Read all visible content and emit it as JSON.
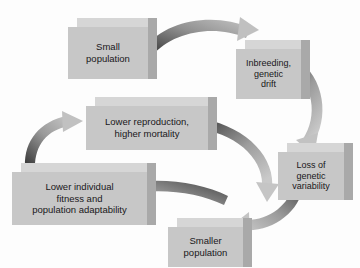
{
  "diagram": {
    "type": "cycle-flow-diagram",
    "background_color": "#fdfdfd",
    "box_front_color": "#c7c7c7",
    "box_top_color": "#d6d6d6",
    "box_side_color": "#a9a9a9",
    "text_color": "#19171a",
    "arrow_dark_color": "#3a3a3a",
    "arrow_light_color": "#c0c0c0",
    "nodes": [
      {
        "id": "small-population",
        "label": "Small\npopulation",
        "x": 68,
        "y": 18,
        "w": 80,
        "h": 52,
        "depth": 9,
        "font_size": 9.5
      },
      {
        "id": "inbreeding-genetic-drift",
        "label": "Inbreeding,\ngenetic\ndrift",
        "x": 236,
        "y": 40,
        "w": 65,
        "h": 50,
        "depth": 9,
        "font_size": 9
      },
      {
        "id": "loss-of-genetic-variability",
        "label": "Loss of\ngenetic\nvariability",
        "x": 278,
        "y": 143,
        "w": 66,
        "h": 48,
        "depth": 9,
        "font_size": 9
      },
      {
        "id": "smaller-population",
        "label": "Smaller\npopulation",
        "x": 168,
        "y": 218,
        "w": 75,
        "h": 40,
        "depth": 9,
        "font_size": 9.5
      },
      {
        "id": "lower-individual-fitness",
        "label": "Lower individual\nfitness and\npopulation adaptability",
        "x": 12,
        "y": 163,
        "w": 135,
        "h": 53,
        "depth": 9,
        "font_size": 9.5
      },
      {
        "id": "lower-reproduction",
        "label": "Lower reproduction,\nhigher mortality",
        "x": 86,
        "y": 97,
        "w": 122,
        "h": 44,
        "depth": 9,
        "font_size": 9.5
      }
    ],
    "arrows": [
      {
        "id": "arrow-small-to-inbreeding",
        "from": "small-population",
        "to": "inbreeding-genetic-drift"
      },
      {
        "id": "arrow-inbreeding-to-loss",
        "from": "inbreeding-genetic-drift",
        "to": "loss-of-genetic-variability"
      },
      {
        "id": "arrow-loss-to-smaller",
        "from": "loss-of-genetic-variability",
        "to": "smaller-population"
      },
      {
        "id": "arrow-smaller-to-fitness",
        "from": "smaller-population",
        "to": "lower-individual-fitness"
      },
      {
        "id": "arrow-fitness-to-reproduction",
        "from": "lower-individual-fitness",
        "to": "lower-reproduction"
      },
      {
        "id": "arrow-reproduction-to-loss",
        "from": "lower-reproduction",
        "to": "loss-of-genetic-variability"
      }
    ]
  }
}
